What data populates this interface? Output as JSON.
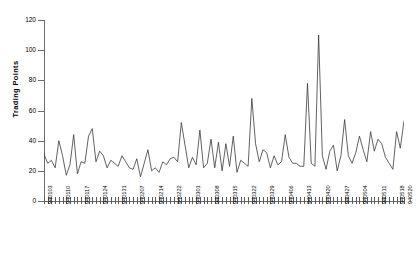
{
  "axes": {
    "y_title": "Trading Points",
    "y_ticks": [
      0,
      20,
      40,
      60,
      80,
      100,
      120
    ],
    "y_min": 0,
    "y_max": 120
  },
  "chart_data": {
    "type": "line",
    "title": "",
    "xlabel": "",
    "ylabel": "Trading Points",
    "ylim": [
      0,
      120
    ],
    "grid": false,
    "legend": "none",
    "line_color": "#3a3a3a",
    "series_name": "Trading Points",
    "tick_label_interval": 5,
    "categories": [
      "940103",
      "940104",
      "940105",
      "940106",
      "940107",
      "940110",
      "940111",
      "940112",
      "940113",
      "940114",
      "940117",
      "940118",
      "940119",
      "940120",
      "940121",
      "940124",
      "940125",
      "940126",
      "940127",
      "940128",
      "940131",
      "940201",
      "940202",
      "940203",
      "940204",
      "940207",
      "940208",
      "940209",
      "940210",
      "940211",
      "940214",
      "940215",
      "940216",
      "940217",
      "940218",
      "940222",
      "940223",
      "940224",
      "940225",
      "940228",
      "940301",
      "940302",
      "940303",
      "940304",
      "940307",
      "940308",
      "940309",
      "940310",
      "940311",
      "940314",
      "940315",
      "940316",
      "940317",
      "940318",
      "940321",
      "940322",
      "940323",
      "940324",
      "940325",
      "940328",
      "940329",
      "940330",
      "940331",
      "940404",
      "940405",
      "940406",
      "940407",
      "940408",
      "940411",
      "940412",
      "940413",
      "940414",
      "940415",
      "940418",
      "940419",
      "940420",
      "940421",
      "940422",
      "940425",
      "940426",
      "940427",
      "940428",
      "940429",
      "940502",
      "940503",
      "940504",
      "940505",
      "940506",
      "940509",
      "940510",
      "940511",
      "940512",
      "940513",
      "940516",
      "940517",
      "940518",
      "940519",
      "940520"
    ],
    "values": [
      31,
      25,
      27,
      22,
      40,
      30,
      17,
      24,
      44,
      18,
      26,
      25,
      43,
      48,
      26,
      33,
      30,
      22,
      27,
      25,
      23,
      30,
      26,
      22,
      21,
      28,
      16,
      25,
      34,
      20,
      22,
      19,
      26,
      24,
      28,
      29,
      26,
      52,
      37,
      22,
      29,
      24,
      47,
      22,
      25,
      41,
      22,
      39,
      20,
      38,
      23,
      43,
      19,
      27,
      25,
      23,
      68,
      38,
      26,
      34,
      32,
      22,
      30,
      24,
      26,
      44,
      29,
      25,
      25,
      23,
      23,
      78,
      25,
      23,
      110,
      30,
      21,
      33,
      37,
      20,
      30,
      54,
      30,
      25,
      32,
      43,
      34,
      26,
      46,
      33,
      41,
      38,
      29,
      25,
      21,
      46,
      35,
      53
    ],
    "annotations": [
      {
        "label": "global maximum",
        "index": 74,
        "value": 110
      },
      {
        "label": "secondary peak",
        "index": 71,
        "value": 78
      },
      {
        "label": "tertiary peak",
        "index": 56,
        "value": 68
      }
    ]
  }
}
